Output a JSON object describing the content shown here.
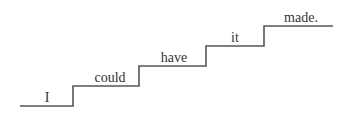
{
  "diagram": {
    "type": "staircase",
    "line_color": "#555555",
    "text_color": "#333333",
    "steps": [
      {
        "label": "I"
      },
      {
        "label": "could"
      },
      {
        "label": "have"
      },
      {
        "label": "it"
      },
      {
        "label": "made."
      }
    ]
  }
}
